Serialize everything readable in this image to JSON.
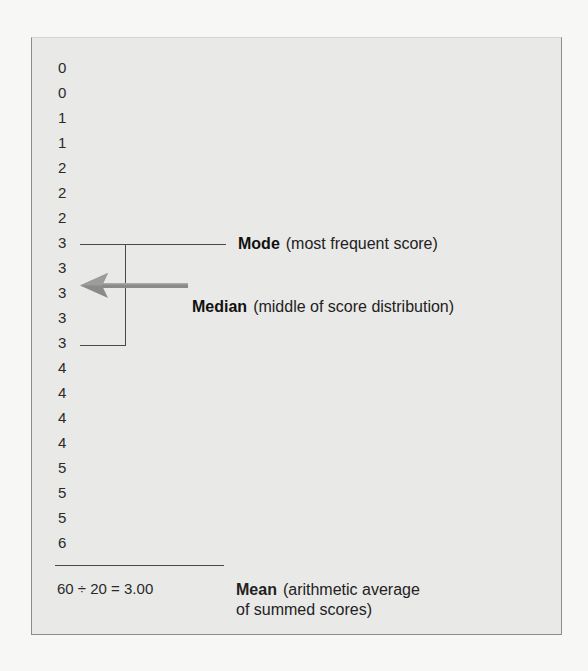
{
  "scores": [
    "0",
    "0",
    "1",
    "1",
    "2",
    "2",
    "2",
    "3",
    "3",
    "3",
    "3",
    "3",
    "4",
    "4",
    "4",
    "4",
    "5",
    "5",
    "5",
    "6"
  ],
  "mode": {
    "term": "Mode",
    "description": "(most frequent score)"
  },
  "median": {
    "term": "Median",
    "description": "(middle of score distribution)"
  },
  "mean": {
    "formula": "60 ÷ 20 = 3.00",
    "term": "Mean",
    "description": "(arithmetic average of summed scores)"
  },
  "icons": {
    "median_pointer": "left-arrow-icon"
  },
  "colors": {
    "panel_bg": "#e9e9e7",
    "arrow": "#8a8a8a",
    "lines": "#4a4a4a"
  }
}
